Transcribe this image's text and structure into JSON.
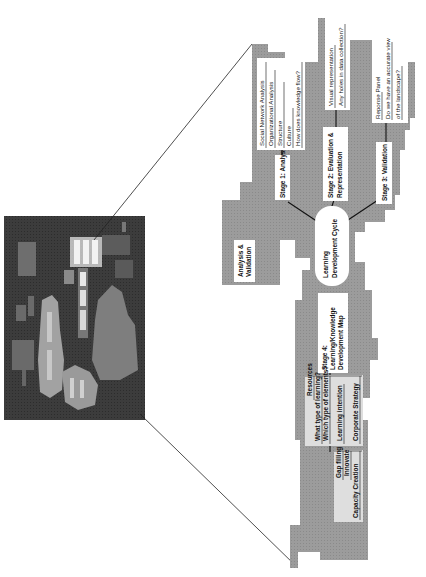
{
  "figure": {
    "thumbnail": {
      "label": "knowledge landscape overview",
      "bg": "#3a3a3a"
    },
    "colors": {
      "region_gray": "#9a9a9a",
      "box_white": "#ffffff",
      "box_light": "#dcdcdc",
      "line": "#111111"
    },
    "hub": {
      "line1": "Learning",
      "line2": "Development Cycle"
    },
    "side_box": {
      "line1": "Analysis &",
      "line2": "Validation"
    },
    "stages": [
      {
        "id": "stage1",
        "line1": "Stage 1: Analysis",
        "line2": ""
      },
      {
        "id": "stage2",
        "line1": "Stage 2: Evaluation &",
        "line2": "Representation"
      },
      {
        "id": "stage3",
        "line1": "Stage 3: Validation",
        "line2": ""
      },
      {
        "id": "stage4",
        "line1": "Stage 4:",
        "line2": "Learning/Knowledge",
        "line3": "Development Map"
      }
    ],
    "details": {
      "analysis": [
        "Social Network Analysis",
        "Organizational Analysis",
        "Structure",
        "Culture",
        "How does knowledge flow?"
      ],
      "evaluation": [
        "Visual representation",
        "Any holes in data collection?"
      ],
      "validation": [
        "Reponse Panel",
        "Do we have an accurate view",
        "of the landscape?"
      ],
      "resources": [
        "Resources",
        "What type of learning?",
        "Which type of elements?",
        "Learning intention",
        "Corporate Strategy"
      ],
      "outcomes": [
        "Gap filling",
        "Innovate",
        "Capacity Creation"
      ]
    }
  }
}
